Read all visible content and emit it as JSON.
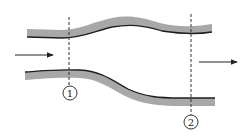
{
  "diagram": {
    "title": "",
    "sections": [
      {
        "label": "1",
        "x": 69
      },
      {
        "label": "2",
        "x": 191
      }
    ],
    "flow_direction": "left-to-right",
    "colors": {
      "wall_fill": "#a8a8a8",
      "wall_edge": "#1e1e1e",
      "line": "#333333"
    }
  }
}
